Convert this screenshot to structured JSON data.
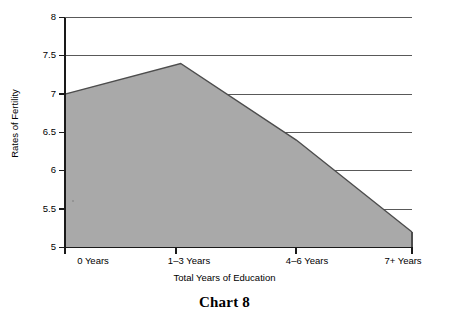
{
  "caption": {
    "text": "Chart 8"
  },
  "chart_data": {
    "type": "area",
    "title": "",
    "subtitle": "",
    "xlabel": "Total Years of Education",
    "ylabel": "Rates of Fertility",
    "categories": [
      "0 Years",
      "1–3 Years",
      "4–6 Years",
      "7+ Years"
    ],
    "values": [
      7.0,
      7.4,
      6.4,
      5.2
    ],
    "series": [
      {
        "name": "Rates of Fertility",
        "values": [
          7.0,
          7.4,
          6.4,
          5.2
        ]
      }
    ],
    "ylim": [
      5,
      8
    ],
    "xlim": [
      0,
      3
    ],
    "yticks": [
      5,
      5.5,
      6,
      6.5,
      7,
      7.5,
      8
    ],
    "ytick_labels": [
      "5",
      "5.5",
      "6",
      "6.5",
      "7",
      "7.5",
      "8"
    ],
    "xtick_labels": [
      "0 Years",
      "1–3 Years",
      "4–6 Years",
      "7+ Years"
    ],
    "grid": "horizontal",
    "legend": "none",
    "annotations": [],
    "colors": {
      "area_fill": "#a9a9a9",
      "area_stroke": "#4d4d4d",
      "axis": "#1a1a1a",
      "gridline": "#595959",
      "text": "#000000",
      "background": "#ffffff"
    }
  }
}
